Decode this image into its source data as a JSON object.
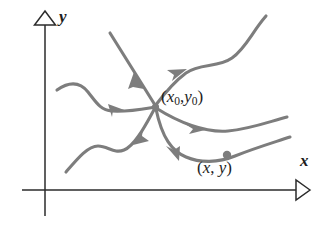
{
  "figure": {
    "kind": "phase-plane-diagram",
    "background_color": "#ffffff",
    "curve_color": "#7d7d7d",
    "axis_color": "#2b2b2b",
    "label_color": "#1d1d1d"
  },
  "axes": {
    "y_axis": {
      "label": "y",
      "arrowhead": "hollow-triangle-up",
      "icon": "axis-arrow-up-icon"
    },
    "x_axis": {
      "label": "x",
      "arrowhead": "hollow-triangle-right",
      "icon": "axis-arrow-right-icon"
    }
  },
  "labels": {
    "equilibrium": {
      "open_paren": "(",
      "x_var": "x",
      "x_sub": "0",
      "comma": ",",
      "y_var": "y",
      "y_sub": "0",
      "close_paren": ")",
      "full_text": "(x0,y0)"
    },
    "point": {
      "open_paren": "(",
      "x_var": "x",
      "comma": ", ",
      "y_var": "y",
      "close_paren": ")",
      "full_text": "(x, y)"
    }
  },
  "markers": {
    "equilibrium_node": "center convergence node",
    "solution_point": "dot on lower-right solution curve"
  },
  "curves": [
    {
      "name": "curve-upper-left-straight",
      "origin": "upper-left",
      "direction": "toward-center",
      "arrow_count": 1
    },
    {
      "name": "curve-upper-right-wavy",
      "origin": "upper-right",
      "direction": "toward-center",
      "arrow_count": 1
    },
    {
      "name": "curve-left-wavy",
      "origin": "left",
      "direction": "toward-center",
      "arrow_count": 1
    },
    {
      "name": "curve-lower-left-wavy",
      "origin": "lower-left",
      "direction": "toward-center",
      "arrow_count": 1
    },
    {
      "name": "curve-right-middle",
      "origin": "right",
      "direction": "toward-center",
      "arrow_count": 1
    },
    {
      "name": "curve-lower-right",
      "origin": "lower-right",
      "direction": "toward-center",
      "arrow_count": 1
    }
  ]
}
